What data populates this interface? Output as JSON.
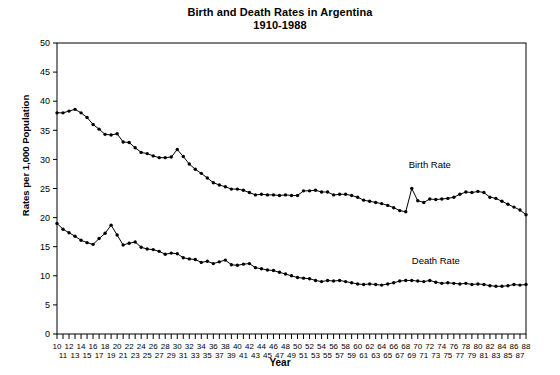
{
  "chart_data": {
    "type": "line",
    "title": "Birth and Death Rates in Argentina",
    "subtitle": "1910-1988",
    "xlabel": "Year",
    "ylabel": "Rates per 1,000 Population",
    "ylim": [
      0,
      50
    ],
    "ytick_step": 5,
    "yticks": [
      0,
      5,
      10,
      15,
      20,
      25,
      30,
      35,
      40,
      45,
      50
    ],
    "xlim": [
      1910,
      1988
    ],
    "grid": false,
    "legend_position": "inline-annotation",
    "marker": "filled-circle",
    "line_color": "#000000",
    "x": [
      1910,
      1911,
      1912,
      1913,
      1914,
      1915,
      1916,
      1917,
      1918,
      1919,
      1920,
      1921,
      1922,
      1923,
      1924,
      1925,
      1926,
      1927,
      1928,
      1929,
      1930,
      1931,
      1932,
      1933,
      1934,
      1935,
      1936,
      1937,
      1938,
      1939,
      1940,
      1941,
      1942,
      1943,
      1944,
      1945,
      1946,
      1947,
      1948,
      1949,
      1950,
      1951,
      1952,
      1953,
      1954,
      1955,
      1956,
      1957,
      1958,
      1959,
      1960,
      1961,
      1962,
      1963,
      1964,
      1965,
      1966,
      1967,
      1968,
      1969,
      1970,
      1971,
      1972,
      1973,
      1974,
      1975,
      1976,
      1977,
      1978,
      1979,
      1980,
      1981,
      1982,
      1983,
      1984,
      1985,
      1986,
      1987,
      1988
    ],
    "xtick_labels_top": [
      "10",
      "12",
      "14",
      "16",
      "18",
      "20",
      "22",
      "24",
      "26",
      "28",
      "30",
      "32",
      "34",
      "36",
      "38",
      "40",
      "42",
      "44",
      "46",
      "48",
      "50",
      "52",
      "54",
      "56",
      "58",
      "60",
      "62",
      "64",
      "66",
      "68",
      "70",
      "72",
      "74",
      "76",
      "78",
      "80",
      "82",
      "84",
      "86",
      "88"
    ],
    "xtick_labels_bottom": [
      "11",
      "13",
      "15",
      "17",
      "19",
      "21",
      "23",
      "25",
      "27",
      "29",
      "31",
      "33",
      "35",
      "37",
      "39",
      "41",
      "43",
      "45",
      "47",
      "49",
      "51",
      "53",
      "55",
      "57",
      "59",
      "61",
      "63",
      "65",
      "67",
      "69",
      "71",
      "73",
      "75",
      "77",
      "79",
      "81",
      "83",
      "85",
      "87"
    ],
    "series": [
      {
        "name": "Birth Rate",
        "label": "Birth Rate",
        "label_x": 1972,
        "label_y": 28.5,
        "values": [
          38.0,
          38.0,
          38.3,
          38.6,
          38.0,
          37.2,
          36.0,
          35.2,
          34.3,
          34.2,
          34.4,
          33.0,
          32.9,
          32.0,
          31.2,
          31.0,
          30.6,
          30.3,
          30.3,
          30.4,
          31.7,
          30.5,
          29.2,
          28.3,
          27.6,
          26.8,
          26.0,
          25.6,
          25.3,
          24.9,
          24.9,
          24.7,
          24.3,
          23.9,
          24.0,
          23.9,
          23.9,
          23.8,
          23.9,
          23.8,
          23.8,
          24.6,
          24.6,
          24.7,
          24.4,
          24.4,
          23.9,
          24.0,
          24.0,
          23.8,
          23.5,
          23.0,
          22.8,
          22.6,
          22.4,
          22.1,
          21.7,
          21.2,
          21.0,
          25.0,
          22.9,
          22.6,
          23.2,
          23.1,
          23.2,
          23.3,
          23.5,
          24.0,
          24.4,
          24.3,
          24.5,
          24.3,
          23.5,
          23.3,
          22.8,
          22.3,
          21.8,
          21.3,
          20.5
        ]
      },
      {
        "name": "Death Rate",
        "label": "Death Rate",
        "label_x": 1973,
        "label_y": 12.0,
        "values": [
          19.0,
          18.0,
          17.4,
          16.8,
          16.1,
          15.7,
          15.4,
          16.4,
          17.3,
          18.7,
          17.0,
          15.3,
          15.6,
          15.8,
          14.9,
          14.6,
          14.5,
          14.2,
          13.7,
          13.9,
          13.8,
          13.1,
          12.9,
          12.8,
          12.3,
          12.5,
          12.1,
          12.4,
          12.7,
          11.9,
          11.8,
          12.0,
          12.1,
          11.4,
          11.2,
          11.0,
          10.9,
          10.6,
          10.3,
          10.0,
          9.7,
          9.6,
          9.5,
          9.2,
          9.0,
          9.2,
          9.1,
          9.2,
          9.0,
          8.8,
          8.6,
          8.5,
          8.6,
          8.5,
          8.4,
          8.6,
          8.8,
          9.1,
          9.2,
          9.2,
          9.1,
          9.0,
          9.2,
          8.9,
          8.7,
          8.8,
          8.7,
          8.6,
          8.7,
          8.5,
          8.6,
          8.5,
          8.3,
          8.2,
          8.2,
          8.3,
          8.5,
          8.4,
          8.5
        ]
      }
    ]
  }
}
